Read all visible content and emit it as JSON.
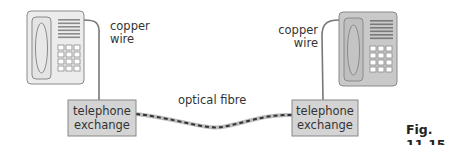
{
  "diagram": {
    "left_phone": {
      "wire_label_line1": "copper",
      "wire_label_line2": "wire",
      "body_color": "#ececec"
    },
    "right_phone": {
      "wire_label_line1": "copper",
      "wire_label_line2": "wire",
      "body_color": "#c9c9c9"
    },
    "left_exchange": {
      "line1": "telephone",
      "line2": "exchange"
    },
    "right_exchange": {
      "line1": "telephone",
      "line2": "exchange"
    },
    "link_label": "optical fibre",
    "caption": "Fig. 11.15",
    "colors": {
      "exchange_fill": "#d4d4d4",
      "outline": "#888888",
      "fibre_light": "#bdbdbd",
      "fibre_dash": "#333333"
    }
  }
}
